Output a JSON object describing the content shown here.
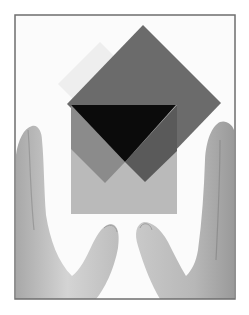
{
  "image": {
    "description": "Grayscale photograph of two hands framing overlapping translucent squares",
    "frame": {
      "x": 15,
      "y": 15,
      "width": 220,
      "height": 284,
      "border_color": "#6e6e6e"
    },
    "colors": {
      "background": "#ffffff",
      "photo_bg": "#fbfbfb",
      "faint_diamond": "#ececec",
      "dark_diamond": "#6a6a6a",
      "light_square": "#b9b9b9",
      "medium_overlap": "#8a8a8a",
      "dark_overlap": "#575757",
      "black_triangle": "#0a0a0a",
      "skin_light": "#d6d6d6",
      "skin_mid": "#b4b4b4",
      "skin_dark": "#8c8c8c"
    }
  }
}
